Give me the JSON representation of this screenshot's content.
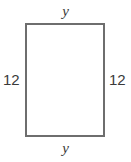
{
  "figure": {
    "kind": "geometry-diagram",
    "shape": "rectangle",
    "stroke_color": "#6e6e6e",
    "fill_color": "#ffffff",
    "text_color": "#3a3a3a",
    "labels": {
      "top": "y",
      "bottom": "y",
      "left": "12",
      "right": "12"
    }
  },
  "chart_data": {
    "type": "table",
    "title": "",
    "categories": [
      "top side",
      "bottom side",
      "left side",
      "right side"
    ],
    "values": [
      "y",
      "y",
      "12",
      "12"
    ]
  }
}
